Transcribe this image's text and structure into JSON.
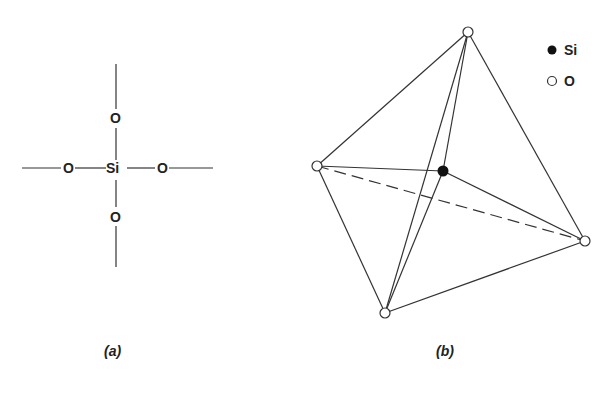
{
  "panel_a": {
    "caption": "(a)",
    "center_atom": "Si",
    "top_atom": "O",
    "bottom_atom": "O",
    "left_atom": "O",
    "right_atom": "O"
  },
  "panel_b": {
    "caption": "(b)",
    "legend": [
      {
        "symbol": "filled-circle",
        "label": "Si"
      },
      {
        "symbol": "open-circle",
        "label": "O"
      }
    ]
  },
  "colors": {
    "line": "#333333",
    "background": "#ffffff"
  }
}
